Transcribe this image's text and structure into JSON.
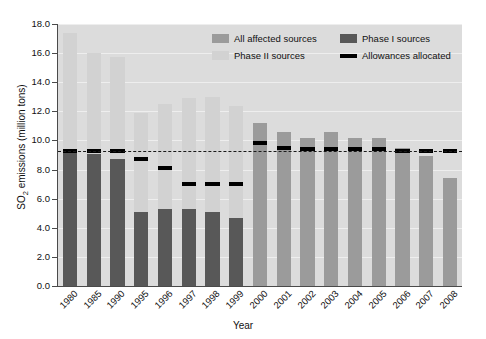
{
  "chart_data": {
    "type": "bar",
    "title": "",
    "xlabel": "Year",
    "ylabel": "SO2 emissions (million tons)",
    "ylabel_parts": {
      "prefix": "SO",
      "sub": "2",
      "suffix": " emissions (million tons)"
    },
    "ylim": [
      0.0,
      18.0
    ],
    "ytick_step": 2.0,
    "yticks": [
      "0.0",
      "2.0",
      "4.0",
      "6.0",
      "8.0",
      "10.0",
      "12.0",
      "14.0",
      "16.0",
      "18.0"
    ],
    "grid": true,
    "legend_position": "top-right-inside",
    "categories": [
      "1980",
      "1985",
      "1990",
      "1995",
      "1996",
      "1997",
      "1998",
      "1999",
      "2000",
      "2001",
      "2002",
      "2003",
      "2004",
      "2005",
      "2006",
      "2007",
      "2008"
    ],
    "series": [
      {
        "name": "All affected sources",
        "color": "#9b9b9b",
        "values": [
          null,
          null,
          null,
          null,
          null,
          null,
          null,
          null,
          11.2,
          10.6,
          10.2,
          10.6,
          10.2,
          10.2,
          9.5,
          8.9,
          7.4
        ]
      },
      {
        "name": "Phase I sources",
        "color": "#585858",
        "values": [
          9.3,
          9.1,
          8.7,
          5.1,
          5.3,
          5.3,
          5.1,
          4.7,
          null,
          null,
          null,
          null,
          null,
          null,
          null,
          null,
          null
        ]
      },
      {
        "name": "Phase II sources",
        "color": "#d2d2d2",
        "values": [
          17.4,
          16.0,
          15.7,
          11.9,
          12.5,
          12.9,
          13.0,
          12.4,
          null,
          null,
          null,
          null,
          null,
          null,
          null,
          null,
          null
        ]
      },
      {
        "name": "Allowances allocated",
        "color": "#000000",
        "values": [
          9.3,
          9.3,
          9.3,
          8.7,
          8.1,
          7.0,
          7.0,
          7.0,
          9.8,
          9.5,
          9.4,
          9.4,
          9.4,
          9.4,
          9.3,
          9.3,
          9.3
        ]
      }
    ],
    "notes": {
      "stacked": "1980-1999 bars are stacked: dark Phase I portion below, light Phase II portion above to the total.",
      "allowance_dashed": "A dashed allowance reference line at about 9.3 spans the full plot width."
    }
  },
  "legend": {
    "entries": [
      {
        "label": "All affected sources",
        "swatch": "all"
      },
      {
        "label": "Phase I sources",
        "swatch": "p1"
      },
      {
        "label": "Phase II sources",
        "swatch": "p2"
      },
      {
        "label": "Allowances allocated",
        "swatch": "line"
      }
    ]
  },
  "axes": {
    "x_title": "Year",
    "y_title_prefix": "SO",
    "y_title_sub": "2",
    "y_title_suffix": " emissions (million tons)"
  },
  "colors": {
    "plot_background": "#dcdcdc",
    "gridline": "#eeeeee",
    "axis": "#4a4a4a",
    "all_affected": "#9b9b9b",
    "phase_i": "#585858",
    "phase_ii": "#d2d2d2",
    "allowances": "#000000",
    "page_background": "#ffffff"
  }
}
